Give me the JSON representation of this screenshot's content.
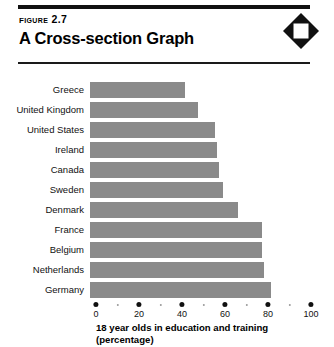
{
  "header": {
    "figure_label": "Figure 2.7",
    "title": "A Cross-section Graph",
    "logo": "diamond-logo"
  },
  "chart_data": {
    "type": "bar",
    "orientation": "horizontal",
    "title": "A Cross-section Graph",
    "figure_number": "Figure 2.7",
    "categories": [
      "Greece",
      "United Kingdom",
      "United States",
      "Ireland",
      "Canada",
      "Sweden",
      "Denmark",
      "France",
      "Belgium",
      "Netherlands",
      "Germany"
    ],
    "values": [
      44,
      50,
      58,
      59,
      60,
      62,
      69,
      80,
      80,
      81,
      84
    ],
    "xlabel": "18 year olds in education and training (percentage)",
    "xlabel_line1": "18 year olds in education and training",
    "xlabel_line2": "(percentage)",
    "ylabel": "",
    "xlim": [
      0,
      100
    ],
    "xticks": [
      0,
      20,
      40,
      60,
      80,
      100
    ],
    "xtick_labels": [
      "0",
      "20",
      "40",
      "60",
      "80",
      "100"
    ],
    "minor_ticks": [
      10,
      30,
      50,
      70,
      90
    ],
    "grid": false,
    "legend": false,
    "bar_color": "#8a8a8a",
    "axis_color": "#111111"
  }
}
